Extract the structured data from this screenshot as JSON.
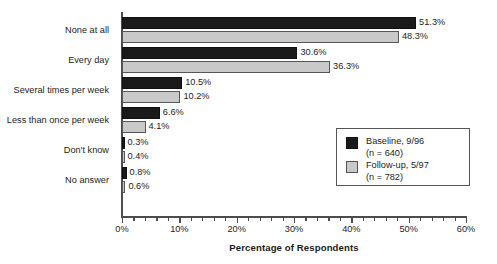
{
  "chart_data": {
    "type": "bar",
    "orientation": "horizontal",
    "title": "",
    "xlabel": "Percentage of Respondents",
    "ylabel": "",
    "xlim": [
      0,
      60
    ],
    "xticks": [
      0,
      10,
      20,
      30,
      40,
      50,
      60
    ],
    "xtick_labels": [
      "0%",
      "10%",
      "20%",
      "30%",
      "40%",
      "50%",
      "60%"
    ],
    "x_minor_tick_step": 2,
    "grid": false,
    "legend_position": "center-right",
    "categories": [
      "None at all",
      "Every day",
      "Several times per week",
      "Less than once per week",
      "Don't know",
      "No answer"
    ],
    "series": [
      {
        "name": "Baseline, 9/96",
        "n_label": "(n = 640)",
        "n": 640,
        "color": "#1a1a1a",
        "values": [
          51.3,
          30.6,
          10.5,
          6.6,
          0.3,
          0.8
        ],
        "value_labels": [
          "51.3%",
          "30.6%",
          "10.5%",
          "6.6%",
          "0.3%",
          "0.8%"
        ]
      },
      {
        "name": "Follow-up, 5/97",
        "n_label": "(n = 782)",
        "n": 782,
        "color": "#c9c9c9",
        "values": [
          48.3,
          36.3,
          10.2,
          4.1,
          0.4,
          0.6
        ],
        "value_labels": [
          "48.3%",
          "36.3%",
          "10.2%",
          "4.1%",
          "0.4%",
          "0.6%"
        ]
      }
    ]
  }
}
